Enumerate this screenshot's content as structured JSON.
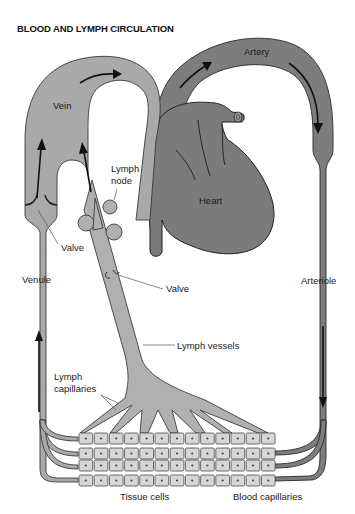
{
  "title": "BLOOD AND LYMPH CIRCULATION",
  "labels": {
    "vein": "Vein",
    "artery": "Artery",
    "heart": "Heart",
    "lymph_node_1": "Lymph",
    "lymph_node_2": "node",
    "valve_vein": "Valve",
    "venule": "Venule",
    "valve_lymph": "Valve",
    "arteriole": "Arteriole",
    "lymph_vessels": "Lymph vessels",
    "lymph_capillaries_1": "Lymph",
    "lymph_capillaries_2": "capillaries",
    "tissue_cells": "Tissue cells",
    "blood_capillaries": "Blood capillaries"
  },
  "colors": {
    "vein": "#a9a9a9",
    "artery": "#7d7d7d",
    "heart": "#7b7b7b",
    "lymph": "#b0b0b0",
    "cells": "#d6d6d6"
  },
  "cell_grid": {
    "rows": 4,
    "columns": 13
  }
}
